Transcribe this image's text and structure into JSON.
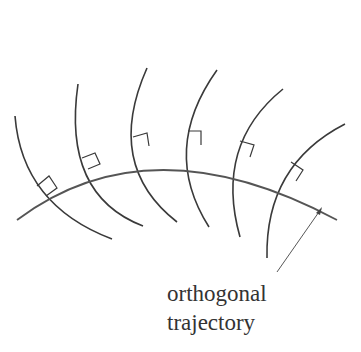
{
  "figure": {
    "label_line1": "orthogonal",
    "label_line2": "trajectory",
    "colors": {
      "curve": "#3a3a3a",
      "trajectory": "#555555",
      "background": "#ffffff"
    },
    "family_curve_count": 6,
    "right_angle_markers": 6
  }
}
